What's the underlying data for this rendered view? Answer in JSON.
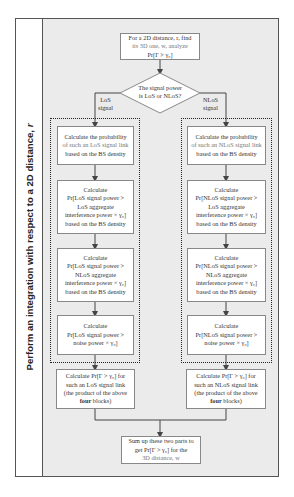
{
  "diagram": {
    "outer_label": {
      "prefix": "Perform an integration with respect to a 2D distance, ",
      "variable": "r"
    },
    "start_box": {
      "lines": [
        "For a 2D distance, r, find",
        "its 3D one, w, analyze",
        "Pr[Γ > γ₀]"
      ]
    },
    "decision": {
      "lines": [
        "The signal power",
        "is LoS or NLoS?"
      ]
    },
    "branches": {
      "left": {
        "label_lines": [
          "LoS",
          "signal"
        ],
        "steps": [
          {
            "lines": [
              "Calculate the probability",
              "of such an LoS signal link",
              "based on the BS density"
            ]
          },
          {
            "lines": [
              "Calculate",
              "Pr[LoS signal power >",
              "LoS aggregate",
              "interference power × γ₀]",
              "based on the BS density"
            ]
          },
          {
            "lines": [
              "Calculate",
              "Pr[LoS signal power >",
              "NLoS aggregate",
              "interference power × γ₀]",
              "based on the BS density"
            ]
          },
          {
            "lines": [
              "Calculate",
              "Pr[LoS signal power >",
              "noise power × γ₀]"
            ]
          }
        ],
        "product": {
          "lines": [
            "Calculate Pr[Γ > γ₀] for",
            "such an LoS signal link",
            "(the product of the above",
            "four blocks)"
          ],
          "bold_word": "four"
        }
      },
      "right": {
        "label_lines": [
          "NLoS",
          "signal"
        ],
        "steps": [
          {
            "lines": [
              "Calculate the probability",
              "of such an NLoS signal link",
              "based on the BS density"
            ]
          },
          {
            "lines": [
              "Calculate",
              "Pr[NLoS signal power >",
              "LoS aggregate",
              "interference power × γ₀]",
              "based on the BS density"
            ]
          },
          {
            "lines": [
              "Calculate",
              "Pr[NLoS signal power >",
              "NLoS aggregate",
              "interference power × γ₀]",
              "based on the BS density"
            ]
          },
          {
            "lines": [
              "Calculate",
              "Pr[NLoS signal power >",
              "noise power × γ₀]"
            ]
          }
        ],
        "product": {
          "lines": [
            "Calculate Pr[Γ > γ₀] for",
            "such an NLoS signal link",
            "(the product of the above",
            "four blocks)"
          ],
          "bold_word": "four"
        }
      }
    },
    "end_box": {
      "lines": [
        "Sum up these two parts to",
        "get Pr[Γ > γ₀] for the",
        "3D distance, w"
      ]
    },
    "colors": {
      "panel_background": "#ebebeb",
      "box_fill": "#ffffff",
      "box_border": "#888888",
      "frame_border": "#555555",
      "connector": "#444444"
    }
  }
}
